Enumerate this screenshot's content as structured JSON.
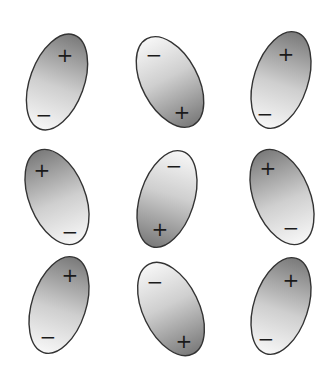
{
  "diagram": {
    "colors": {
      "dark_end": "#7a7a7a",
      "light_end": "#f7f7f7",
      "outline": "#333333",
      "sign": "#1a1a1a"
    },
    "labels": {
      "plus": "+",
      "minus": "−"
    },
    "molecules": [
      {
        "row": 1,
        "col": 1,
        "cx": 57,
        "cy": 82,
        "rx": 27,
        "ry": 50,
        "angle": 20,
        "positive_end": "top",
        "plus": {
          "x": 65,
          "y": 55
        },
        "minus": {
          "x": 44,
          "y": 115
        }
      },
      {
        "row": 1,
        "col": 2,
        "cx": 170,
        "cy": 82,
        "rx": 28,
        "ry": 49,
        "angle": -28,
        "positive_end": "bottom",
        "plus": {
          "x": 182,
          "y": 112
        },
        "minus": {
          "x": 154,
          "y": 55
        }
      },
      {
        "row": 1,
        "col": 3,
        "cx": 281,
        "cy": 80,
        "rx": 27,
        "ry": 50,
        "angle": 18,
        "positive_end": "top",
        "plus": {
          "x": 286,
          "y": 54
        },
        "minus": {
          "x": 265,
          "y": 114
        }
      },
      {
        "row": 2,
        "col": 1,
        "cx": 57,
        "cy": 197,
        "rx": 28,
        "ry": 50,
        "angle": -22,
        "positive_end": "top",
        "plus": {
          "x": 42,
          "y": 170
        },
        "minus": {
          "x": 70,
          "y": 232
        }
      },
      {
        "row": 2,
        "col": 2,
        "cx": 167,
        "cy": 199,
        "rx": 27,
        "ry": 50,
        "angle": 18,
        "positive_end": "bottom",
        "plus": {
          "x": 160,
          "y": 229
        },
        "minus": {
          "x": 174,
          "y": 166
        }
      },
      {
        "row": 2,
        "col": 3,
        "cx": 282,
        "cy": 197,
        "rx": 28,
        "ry": 50,
        "angle": -22,
        "positive_end": "top",
        "plus": {
          "x": 268,
          "y": 168
        },
        "minus": {
          "x": 291,
          "y": 228
        }
      },
      {
        "row": 3,
        "col": 1,
        "cx": 59,
        "cy": 305,
        "rx": 27,
        "ry": 50,
        "angle": 18,
        "positive_end": "top",
        "plus": {
          "x": 70,
          "y": 275
        },
        "minus": {
          "x": 48,
          "y": 337
        }
      },
      {
        "row": 3,
        "col": 2,
        "cx": 171,
        "cy": 309,
        "rx": 28,
        "ry": 50,
        "angle": -26,
        "positive_end": "bottom",
        "plus": {
          "x": 184,
          "y": 341
        },
        "minus": {
          "x": 155,
          "y": 282
        }
      },
      {
        "row": 3,
        "col": 3,
        "cx": 281,
        "cy": 306,
        "rx": 27,
        "ry": 50,
        "angle": 18,
        "positive_end": "top",
        "plus": {
          "x": 291,
          "y": 280
        },
        "minus": {
          "x": 266,
          "y": 339
        }
      }
    ]
  }
}
